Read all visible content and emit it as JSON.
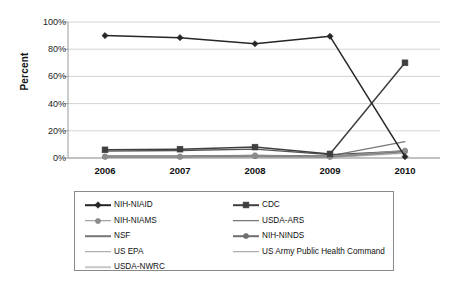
{
  "chart_data": {
    "type": "line",
    "title": "",
    "xlabel": "",
    "ylabel": "Percent",
    "categories": [
      "2006",
      "2007",
      "2008",
      "2009",
      "2010"
    ],
    "ylim": [
      0,
      100
    ],
    "yticks": [
      "0%",
      "20%",
      "40%",
      "60%",
      "80%",
      "100%"
    ],
    "ytick_values": [
      0,
      20,
      40,
      60,
      80,
      100
    ],
    "grid": true,
    "legend_position": "bottom",
    "series": [
      {
        "name": "NIH-NIAID",
        "values": [
          90,
          88.5,
          84,
          89.5,
          1
        ],
        "color": "#262626",
        "marker": "diamond"
      },
      {
        "name": "CDC",
        "values": [
          6,
          6.5,
          8,
          3,
          70
        ],
        "color": "#3f3f3f",
        "marker": "square"
      },
      {
        "name": "NIH-NIAMS",
        "values": [
          1,
          1,
          2,
          1,
          5.5
        ],
        "color": "#8c8c8c",
        "marker": "circle"
      },
      {
        "name": "USDA-ARS",
        "values": [
          5,
          5.5,
          6.5,
          2.5,
          5
        ],
        "color": "#555555",
        "marker": "none"
      },
      {
        "name": "NSF",
        "values": [
          1.5,
          1.5,
          2,
          1.5,
          12
        ],
        "color": "#777777",
        "marker": "none"
      },
      {
        "name": "NIH-NINDS",
        "values": [
          1,
          1,
          1.5,
          1,
          5
        ],
        "color": "#6e6e6e",
        "marker": "circle"
      },
      {
        "name": "US EPA",
        "values": [
          0.8,
          0.8,
          1,
          0.8,
          4.5
        ],
        "color": "#a0a0a0",
        "marker": "none"
      },
      {
        "name": "US Army Public Health Command",
        "values": [
          0.5,
          0.5,
          0.8,
          0.5,
          4
        ],
        "color": "#9a9a9a",
        "marker": "none"
      },
      {
        "name": "USDA-NWRC",
        "values": [
          0.3,
          0.3,
          0.5,
          0.3,
          3.5
        ],
        "color": "#c8c8c8",
        "marker": "none"
      }
    ]
  },
  "legend": {
    "entries": [
      {
        "label": "NIH-NIAID"
      },
      {
        "label": "CDC"
      },
      {
        "label": "NIH-NIAMS"
      },
      {
        "label": "USDA-ARS"
      },
      {
        "label": "NSF"
      },
      {
        "label": "NIH-NINDS"
      },
      {
        "label": "US EPA"
      },
      {
        "label": "US Army Public Health Command"
      },
      {
        "label": "USDA-NWRC"
      }
    ]
  },
  "colors": {
    "gridline": "#d4d4d4",
    "axis": "#9a9a9a",
    "text": "#111111",
    "legend_border": "#8a8a8a"
  }
}
